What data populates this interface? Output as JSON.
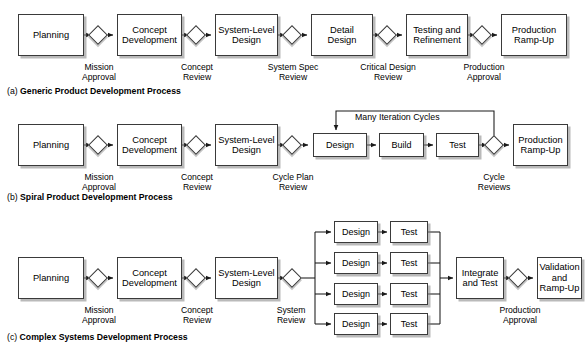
{
  "figure": {
    "background": "#ffffff",
    "box_border_color": "#3a3a3a",
    "shadow_color": "#828282"
  },
  "rows": [
    {
      "id": "generic",
      "caption_letter": "(a)",
      "caption_text": "Generic Product Development Process",
      "boxes": [
        {
          "name": "planning",
          "lines": [
            "Planning"
          ]
        },
        {
          "name": "concept-development",
          "lines": [
            "Concept",
            "Development"
          ]
        },
        {
          "name": "system-level-design",
          "lines": [
            "System-Level",
            "Design"
          ]
        },
        {
          "name": "detail-design",
          "lines": [
            "Detail",
            "Design"
          ]
        },
        {
          "name": "testing-and-refinement",
          "lines": [
            "Testing and",
            "Refinement"
          ]
        },
        {
          "name": "production-ramp-up",
          "lines": [
            "Production",
            "Ramp-Up"
          ]
        }
      ],
      "gates": [
        {
          "name": "mission-approval",
          "lines": [
            "Mission",
            "Approval"
          ]
        },
        {
          "name": "concept-review",
          "lines": [
            "Concept",
            "Review"
          ]
        },
        {
          "name": "system-spec-review",
          "lines": [
            "System Spec",
            "Review"
          ]
        },
        {
          "name": "critical-design-review",
          "lines": [
            "Critical Design",
            "Review"
          ]
        },
        {
          "name": "production-approval",
          "lines": [
            "Production",
            "Approval"
          ]
        }
      ]
    },
    {
      "id": "spiral",
      "caption_letter": "(b)",
      "caption_text": "Spiral Product Development Process",
      "loop_label": "Many Iteration Cycles",
      "boxes": [
        {
          "name": "planning",
          "lines": [
            "Planning"
          ]
        },
        {
          "name": "concept-development",
          "lines": [
            "Concept",
            "Development"
          ]
        },
        {
          "name": "system-level-design",
          "lines": [
            "System-Level",
            "Design"
          ]
        },
        {
          "name": "design",
          "lines": [
            "Design"
          ]
        },
        {
          "name": "build",
          "lines": [
            "Build"
          ]
        },
        {
          "name": "test",
          "lines": [
            "Test"
          ]
        },
        {
          "name": "production-ramp-up",
          "lines": [
            "Production",
            "Ramp-Up"
          ]
        }
      ],
      "gates": [
        {
          "name": "mission-approval",
          "lines": [
            "Mission",
            "Approval"
          ]
        },
        {
          "name": "concept-review",
          "lines": [
            "Concept",
            "Review"
          ]
        },
        {
          "name": "cycle-plan-review",
          "lines": [
            "Cycle Plan",
            "Review"
          ]
        },
        {
          "name": "cycle-reviews",
          "lines": [
            "Cycle",
            "Reviews"
          ]
        }
      ]
    },
    {
      "id": "complex",
      "caption_letter": "(c)",
      "caption_text": "Complex Systems Development Process",
      "boxes": [
        {
          "name": "planning",
          "lines": [
            "Planning"
          ]
        },
        {
          "name": "concept-development",
          "lines": [
            "Concept",
            "Development"
          ]
        },
        {
          "name": "system-level-design",
          "lines": [
            "System-Level",
            "Design"
          ]
        },
        {
          "name": "integrate-and-test",
          "lines": [
            "Integrate",
            "and Test"
          ]
        },
        {
          "name": "validation-and-ramp-up",
          "lines": [
            "Validation",
            "and Ramp-Up"
          ]
        }
      ],
      "parallel_branches": [
        {
          "design": "Design",
          "test": "Test"
        },
        {
          "design": "Design",
          "test": "Test"
        },
        {
          "design": "Design",
          "test": "Test"
        },
        {
          "design": "Design",
          "test": "Test"
        }
      ],
      "gates": [
        {
          "name": "mission-approval",
          "lines": [
            "Mission",
            "Approval"
          ]
        },
        {
          "name": "concept-review",
          "lines": [
            "Concept",
            "Review"
          ]
        },
        {
          "name": "system-review",
          "lines": [
            "System",
            "Review"
          ]
        },
        {
          "name": "production-approval",
          "lines": [
            "Production",
            "Approval"
          ]
        }
      ]
    }
  ]
}
